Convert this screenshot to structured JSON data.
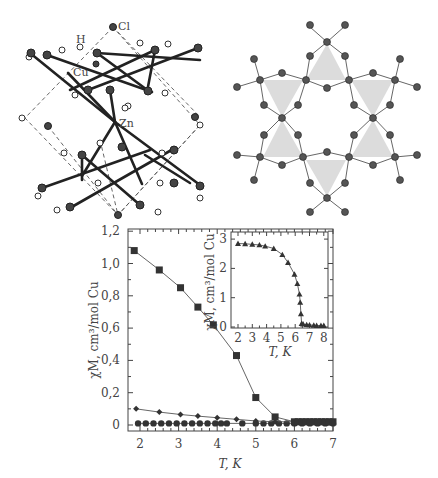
{
  "figure": {
    "structure_left": {
      "atom_labels": [
        "Cl",
        "H",
        "Cu",
        "Zn"
      ],
      "description": "3D crystal structure unit cell (ball-and-stick, dashed cell edges)"
    },
    "structure_right": {
      "description": "Kagome lattice of Cu triangles (shaded) viewed along c-axis"
    }
  },
  "chart_data": [
    {
      "type": "scatter",
      "title": "",
      "xlabel": "T, K",
      "ylabel": "χM, cm³/mol Cu",
      "xlim": [
        1.8,
        7
      ],
      "ylim": [
        -0.02,
        1.2
      ],
      "xticks": [
        "2",
        "3",
        "4",
        "5",
        "6",
        "7"
      ],
      "yticks": [
        "0",
        "0,2",
        "0,4",
        "0,6",
        "0,8",
        "1,0",
        "1,2"
      ],
      "grid": false,
      "legend": null,
      "series": [
        {
          "name": "squares",
          "marker": "square",
          "x": [
            1.85,
            2.5,
            3.05,
            3.5,
            3.9,
            4.5,
            5.0,
            5.5,
            6.0,
            6.1,
            6.2,
            6.3,
            6.4,
            6.5,
            6.6,
            6.7,
            6.8,
            6.9,
            7.0
          ],
          "y": [
            1.08,
            0.96,
            0.85,
            0.73,
            0.62,
            0.43,
            0.17,
            0.05,
            0.02,
            0.02,
            0.02,
            0.02,
            0.02,
            0.02,
            0.02,
            0.02,
            0.02,
            0.02,
            0.02
          ]
        },
        {
          "name": "diamonds",
          "marker": "diamond",
          "x": [
            1.9,
            2.5,
            3.05,
            3.5,
            4.0,
            4.5,
            5.0,
            5.5,
            6.0,
            6.5,
            7.0
          ],
          "y": [
            0.1,
            0.08,
            0.065,
            0.055,
            0.045,
            0.035,
            0.025,
            0.02,
            0.02,
            0.02,
            0.02
          ],
          "line": true
        },
        {
          "name": "circles",
          "marker": "circle",
          "x": [
            1.95,
            2.15,
            2.35,
            2.55,
            2.75,
            2.95,
            3.15,
            3.35,
            3.55,
            3.75,
            3.95,
            4.1,
            4.25,
            4.65,
            5.0,
            5.2,
            5.4,
            5.6,
            5.8,
            6.0,
            6.2,
            6.4,
            6.6,
            6.8,
            7.0
          ],
          "y": [
            0.01,
            0.01,
            0.01,
            0.01,
            0.01,
            0.01,
            0.01,
            0.01,
            0.01,
            0.01,
            0.01,
            0.01,
            0.01,
            0.01,
            0.01,
            0.01,
            0.01,
            0.01,
            0.01,
            0.01,
            0.01,
            0.01,
            0.01,
            0.01,
            0.01
          ]
        }
      ]
    },
    {
      "type": "scatter",
      "title": "inset",
      "xlabel": "T, K",
      "ylabel": "χM, cm³/mol Cu",
      "xlim": [
        1.8,
        8.2
      ],
      "ylim": [
        0,
        3.1
      ],
      "xticks": [
        "2",
        "3",
        "4",
        "5",
        "6",
        "7",
        "8"
      ],
      "yticks": [
        "0",
        "1",
        "2",
        "3"
      ],
      "series": [
        {
          "name": "triangles",
          "marker": "triangle",
          "x": [
            2.0,
            2.5,
            3.0,
            3.5,
            3.9,
            4.5,
            5.1,
            5.5,
            5.95,
            6.15,
            6.3,
            6.35,
            6.4,
            6.45,
            6.55,
            6.8,
            7.0,
            7.3,
            7.5,
            7.8,
            8.0
          ],
          "y": [
            2.85,
            2.84,
            2.82,
            2.8,
            2.76,
            2.68,
            2.47,
            2.2,
            1.8,
            1.48,
            1.12,
            0.84,
            0.45,
            0.12,
            0.1,
            0.08,
            0.07,
            0.06,
            0.05,
            0.05,
            0.05
          ],
          "line": true
        }
      ]
    }
  ]
}
